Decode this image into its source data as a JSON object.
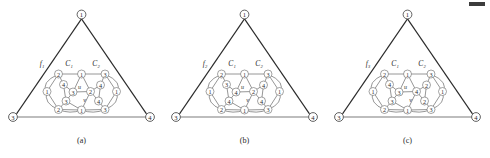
{
  "figure": {
    "panel_count": 3,
    "vertex_radius": 4.0,
    "corner_radius": 4.4,
    "colors": {
      "background": "#ffffff",
      "outer_edge": "#2b2b2b",
      "base_edge": "#7d7d7d",
      "inner_edge": "#555555",
      "node_fill": "#ffffff",
      "node_stroke": "#6a6a6a",
      "text": "#2a2a2a"
    },
    "top_mark": "■"
  },
  "panels": [
    {
      "id": "a",
      "caption": "(a)",
      "face_label": "f₁",
      "cycle_labels": {
        "c1": "C₁",
        "c2": "C₂"
      },
      "inner_labels": {
        "u": "u",
        "v": "v"
      },
      "corners": [
        {
          "name": "apex",
          "label": "1",
          "x": 81.5,
          "y": 14.5
        },
        {
          "name": "bottom-left",
          "label": "3",
          "x": 13.0,
          "y": 117.0
        },
        {
          "name": "bottom-right",
          "label": "4",
          "x": 150.0,
          "y": 117.0
        }
      ],
      "inner_nodes": [
        {
          "name": "top-left",
          "label": "2",
          "x": 58.5,
          "y": 74.0
        },
        {
          "name": "top-center",
          "label": "1",
          "x": 81.5,
          "y": 74.0
        },
        {
          "name": "top-right",
          "label": "3",
          "x": 105.0,
          "y": 74.0
        },
        {
          "name": "upper-left-in",
          "label": "4",
          "x": 63.5,
          "y": 84.5
        },
        {
          "name": "left-outer",
          "label": "1",
          "x": 47.0,
          "y": 91.5
        },
        {
          "name": "u-node",
          "label": "3",
          "x": 73.0,
          "y": 92.0
        },
        {
          "name": "v-node",
          "label": "2",
          "x": 90.5,
          "y": 91.5
        },
        {
          "name": "upper-right-in",
          "label": "4",
          "x": 100.5,
          "y": 85.0
        },
        {
          "name": "right-outer",
          "label": "1",
          "x": 116.5,
          "y": 91.5
        },
        {
          "name": "lower-left-in",
          "label": "3",
          "x": 66.0,
          "y": 101.0
        },
        {
          "name": "lower-right-in",
          "label": "4",
          "x": 98.5,
          "y": 101.0
        },
        {
          "name": "bottom-left-in",
          "label": "2",
          "x": 58.5,
          "y": 109.5
        },
        {
          "name": "bottom-center",
          "label": "1",
          "x": 81.5,
          "y": 110.0
        },
        {
          "name": "bottom-right-in",
          "label": "3",
          "x": 105.0,
          "y": 109.5
        }
      ]
    },
    {
      "id": "b",
      "caption": "(b)",
      "face_label": "f₂",
      "cycle_labels": {
        "c1": "C₁",
        "c2": "C₂"
      },
      "inner_labels": {
        "u": "u",
        "v": "v"
      },
      "corners": [
        {
          "name": "apex",
          "label": "1",
          "x": 81.5,
          "y": 14.5
        },
        {
          "name": "bottom-left",
          "label": "3",
          "x": 13.0,
          "y": 117.0
        },
        {
          "name": "bottom-right",
          "label": "4",
          "x": 150.0,
          "y": 117.0
        }
      ],
      "inner_nodes": [
        {
          "name": "top-left",
          "label": "2",
          "x": 58.5,
          "y": 74.0
        },
        {
          "name": "top-center",
          "label": "1",
          "x": 81.5,
          "y": 74.0
        },
        {
          "name": "top-right",
          "label": "3",
          "x": 105.0,
          "y": 74.0
        },
        {
          "name": "upper-left-in",
          "label": "3",
          "x": 63.5,
          "y": 84.5
        },
        {
          "name": "left-outer",
          "label": "1",
          "x": 47.0,
          "y": 91.5
        },
        {
          "name": "u-node",
          "label": "4",
          "x": 73.0,
          "y": 92.0
        },
        {
          "name": "v-node",
          "label": "2",
          "x": 90.5,
          "y": 91.5
        },
        {
          "name": "upper-right-in",
          "label": "4",
          "x": 100.5,
          "y": 85.0
        },
        {
          "name": "right-outer",
          "label": "1",
          "x": 116.5,
          "y": 91.5
        },
        {
          "name": "lower-left-in",
          "label": "4",
          "x": 66.0,
          "y": 101.0
        },
        {
          "name": "lower-right-in",
          "label": "4",
          "x": 98.5,
          "y": 101.0
        },
        {
          "name": "bottom-left-in",
          "label": "2",
          "x": 58.5,
          "y": 109.5
        },
        {
          "name": "bottom-center",
          "label": "1",
          "x": 81.5,
          "y": 110.0
        },
        {
          "name": "bottom-right-in",
          "label": "3",
          "x": 105.0,
          "y": 109.5
        }
      ]
    },
    {
      "id": "c",
      "caption": "(c)",
      "face_label": "f₃",
      "cycle_labels": {
        "c1": "C₁",
        "c2": "C₂"
      },
      "inner_labels": {
        "u": "u",
        "v": "v"
      },
      "corners": [
        {
          "name": "apex",
          "label": "1",
          "x": 81.5,
          "y": 14.5
        },
        {
          "name": "bottom-left",
          "label": "3",
          "x": 13.0,
          "y": 117.0
        },
        {
          "name": "bottom-right",
          "label": "4",
          "x": 150.0,
          "y": 117.0
        }
      ],
      "inner_nodes": [
        {
          "name": "top-left",
          "label": "2",
          "x": 58.5,
          "y": 74.0
        },
        {
          "name": "top-center",
          "label": "1",
          "x": 81.5,
          "y": 74.0
        },
        {
          "name": "top-right",
          "label": "3",
          "x": 105.0,
          "y": 74.0
        },
        {
          "name": "upper-left-in",
          "label": "4",
          "x": 63.5,
          "y": 84.5
        },
        {
          "name": "left-outer",
          "label": "1",
          "x": 47.0,
          "y": 91.5
        },
        {
          "name": "u-node",
          "label": "3",
          "x": 73.0,
          "y": 92.0
        },
        {
          "name": "v-node",
          "label": "4",
          "x": 90.5,
          "y": 91.5
        },
        {
          "name": "upper-right-in",
          "label": "2",
          "x": 100.5,
          "y": 85.0
        },
        {
          "name": "right-outer",
          "label": "1",
          "x": 116.5,
          "y": 91.5
        },
        {
          "name": "lower-left-in",
          "label": "3",
          "x": 66.0,
          "y": 101.0
        },
        {
          "name": "lower-right-in",
          "label": "2",
          "x": 98.5,
          "y": 101.0
        },
        {
          "name": "bottom-left-in",
          "label": "2",
          "x": 58.5,
          "y": 109.5
        },
        {
          "name": "bottom-center",
          "label": "1",
          "x": 81.5,
          "y": 110.0
        },
        {
          "name": "bottom-right-in",
          "label": "3",
          "x": 105.0,
          "y": 109.5
        }
      ]
    }
  ]
}
